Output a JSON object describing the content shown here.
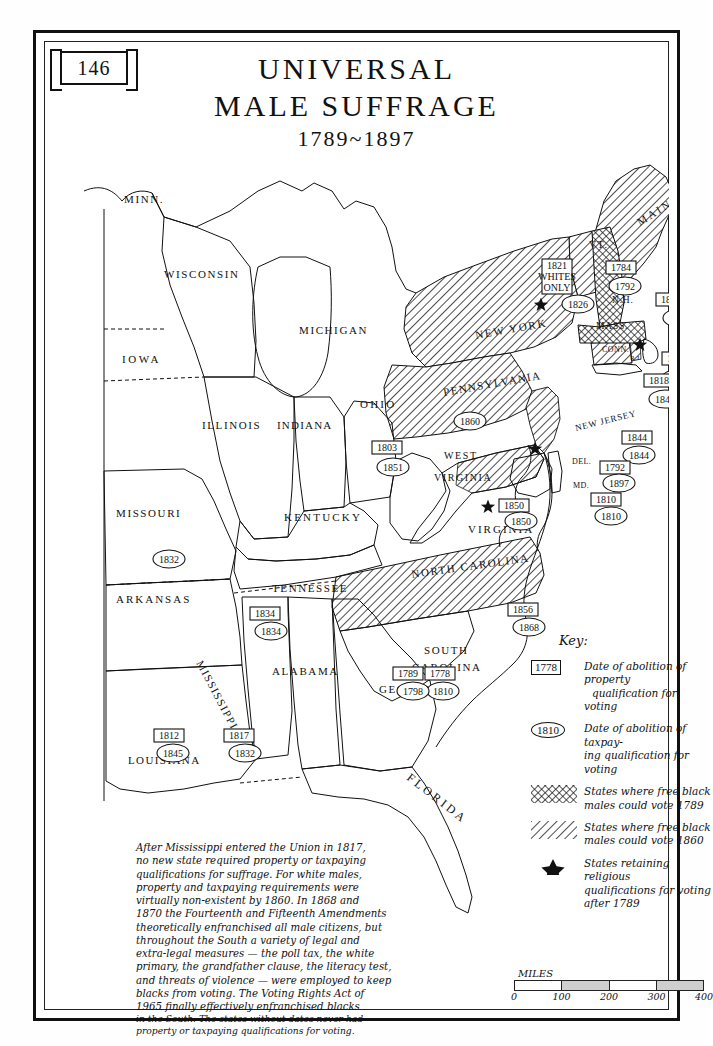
{
  "page": {
    "number": "146"
  },
  "title": {
    "line1": "UNIVERSAL",
    "line2": "MALE SUFFRAGE",
    "years": "1789~1897"
  },
  "key": {
    "heading": "Key:",
    "items": [
      {
        "symbol": "rect",
        "sample": "1778",
        "line1": "Date of abolition of property",
        "line2": "qualification  for voting"
      },
      {
        "symbol": "oval",
        "sample": "1810",
        "line1": "Date of abolition of taxpay-",
        "line2": "ing qualification for voting"
      },
      {
        "symbol": "hatch-1789",
        "sample": "",
        "line1": "States where free black",
        "line2": "males could vote 1789"
      },
      {
        "symbol": "hatch-1860",
        "sample": "",
        "line1": "States where free black",
        "line2": "males could vote 1860"
      },
      {
        "symbol": "star",
        "sample": "",
        "line1": "States retaining religious",
        "line2": "qualifications for voting",
        "line3": "after 1789"
      }
    ]
  },
  "note": {
    "lines": [
      "After Mississippi entered the Union in 1817,",
      "no new state required property or taxpaying",
      "qualifications for suffrage. For white males,",
      "property and taxpaying requirements were",
      "virtually non-existent by 1860. In 1868 and",
      "1870 the Fourteenth and Fifteenth Amendments",
      "theoretically enfranchised all male citizens, but",
      "throughout the South a variety of legal and",
      "extra-legal measures — the poll tax, the white",
      "primary, the grandfather clause, the literacy test,",
      "and threats of violence — were employed to keep",
      "blacks from voting. The Voting Rights Act of",
      "1965 finally effectively enfranchised blacks",
      "in the South. The states without dates never had",
      "property or taxpaying qualifications for voting."
    ]
  },
  "scale": {
    "label": "MILES",
    "ticks": [
      "0",
      "100",
      "200",
      "300",
      "400"
    ]
  },
  "states": [
    {
      "name": "MINN.",
      "x": 80,
      "y": 162,
      "size": 11,
      "spacing": 1.6
    },
    {
      "name": "WISCONSIN",
      "x": 120,
      "y": 237,
      "size": 11,
      "spacing": 1.6
    },
    {
      "name": "MICHIGAN",
      "x": 255,
      "y": 293,
      "size": 11,
      "spacing": 1.6
    },
    {
      "name": "IOWA",
      "x": 78,
      "y": 322,
      "size": 11,
      "spacing": 2.6
    },
    {
      "name": "ILLINOIS",
      "x": 158,
      "y": 388,
      "size": 11,
      "spacing": 1.6
    },
    {
      "name": "INDIANA",
      "x": 233,
      "y": 388,
      "size": 11,
      "spacing": 1.2
    },
    {
      "name": "OHIO",
      "x": 316,
      "y": 367,
      "size": 11,
      "spacing": 2.2
    },
    {
      "name": "MISSOURI",
      "x": 72,
      "y": 476,
      "size": 11,
      "spacing": 1.6
    },
    {
      "name": "KENTUCKY",
      "x": 240,
      "y": 480,
      "size": 11,
      "spacing": 2.2
    },
    {
      "name": "WEST",
      "x": 400,
      "y": 418,
      "size": 10,
      "spacing": 1.6
    },
    {
      "name": "VIRGINIA",
      "x": 390,
      "y": 440,
      "size": 10,
      "spacing": 1.6
    },
    {
      "name": "VIRGINIA",
      "x": 424,
      "y": 492,
      "size": 11,
      "spacing": 2.0
    },
    {
      "name": "ARKANSAS",
      "x": 72,
      "y": 562,
      "size": 11,
      "spacing": 2.0
    },
    {
      "name": "TENNESSEE",
      "x": 228,
      "y": 551,
      "size": 11,
      "spacing": 1.6
    },
    {
      "name": "MISSISSIPPI",
      "x": 152,
      "y": 622,
      "size": 11,
      "spacing": 1.4,
      "rotate": 62
    },
    {
      "name": "ALABAMA",
      "x": 228,
      "y": 634,
      "size": 11,
      "spacing": 1.6
    },
    {
      "name": "LOUISIANA",
      "x": 84,
      "y": 723,
      "size": 11,
      "spacing": 1.4
    },
    {
      "name": "GEORGIA",
      "x": 335,
      "y": 652,
      "size": 11,
      "spacing": 1.6
    },
    {
      "name": "FLORIDA",
      "x": 362,
      "y": 738,
      "size": 12,
      "spacing": 3.0,
      "rotate": 38
    },
    {
      "name": "SOUTH",
      "x": 380,
      "y": 613,
      "size": 11,
      "spacing": 1.6
    },
    {
      "name": "CAROLINA",
      "x": 368,
      "y": 630,
      "size": 11,
      "spacing": 1.6
    },
    {
      "name": "NORTH CAROLINA",
      "x": 368,
      "y": 537,
      "size": 11,
      "spacing": 1.6,
      "rotate": -8
    },
    {
      "name": "PENNSYLVANIA",
      "x": 400,
      "y": 355,
      "size": 11,
      "spacing": 1.4,
      "rotate": -10
    },
    {
      "name": "NEW YORK",
      "x": 432,
      "y": 298,
      "size": 11,
      "spacing": 1.8,
      "rotate": -10
    },
    {
      "name": "MAINE",
      "x": 596,
      "y": 185,
      "size": 11,
      "spacing": 2.4,
      "rotate": -32
    },
    {
      "name": "VT.",
      "x": 545,
      "y": 207,
      "size": 10,
      "spacing": 1.4
    },
    {
      "name": "N.H.",
      "x": 568,
      "y": 262,
      "size": 9.5,
      "spacing": 0.8
    },
    {
      "name": "MASS.",
      "x": 552,
      "y": 288,
      "size": 9.5,
      "spacing": 0.8
    },
    {
      "name": "CONN.",
      "x": 558,
      "y": 311,
      "size": 8,
      "spacing": 0.5
    },
    {
      "name": "R.I.",
      "x": 586,
      "y": 319,
      "size": 7,
      "spacing": 0.3
    },
    {
      "name": "NEW JERSEY",
      "x": 532,
      "y": 390,
      "size": 9,
      "spacing": 0.8,
      "rotate": -14
    },
    {
      "name": "DEL.",
      "x": 528,
      "y": 423,
      "size": 8,
      "spacing": 0.4
    },
    {
      "name": "MD.",
      "x": 529,
      "y": 447,
      "size": 8,
      "spacing": 0.4
    }
  ],
  "date_labels": [
    {
      "state": "new-york",
      "rect": "1821",
      "rect_extra": [
        "WHITES",
        "ONLY"
      ],
      "oval": "1826",
      "rx": 498,
      "ry": 218,
      "ox": 519,
      "oy": 256
    },
    {
      "state": "new-hampshire",
      "rect": "1784",
      "oval": "1792",
      "rx": 562,
      "ry": 220,
      "ox": 566,
      "oy": 238
    },
    {
      "state": "massachusetts",
      "rect": "1821",
      "oval": "1863",
      "rx": 612,
      "ry": 252,
      "ox": 620,
      "oy": 270
    },
    {
      "state": "rhode-island",
      "rect": "1842",
      "oval": "1860",
      "rx": 618,
      "ry": 311,
      "ox": 618,
      "oy": 331
    },
    {
      "state": "connecticut",
      "rect": "1818",
      "oval": "1845",
      "rx": 600,
      "ry": 333,
      "ox": 606,
      "oy": 351
    },
    {
      "state": "pennsylvania",
      "rect": "",
      "oval": "1860",
      "ox": 411,
      "oy": 373
    },
    {
      "state": "new-jersey",
      "rect": "1844",
      "oval": "1844",
      "rx": 578,
      "ry": 390,
      "ox": 580,
      "oy": 407
    },
    {
      "state": "delaware",
      "rect": "1792",
      "oval": "1897",
      "rx": 556,
      "ry": 420,
      "ox": 560,
      "oy": 435
    },
    {
      "state": "maryland",
      "rect": "1810",
      "oval": "1810",
      "rx": 547,
      "ry": 452,
      "ox": 552,
      "oy": 468
    },
    {
      "state": "ohio",
      "rect": "1803",
      "oval": "1851",
      "rx": 328,
      "ry": 400,
      "ox": 334,
      "oy": 419
    },
    {
      "state": "virginia",
      "rect": "1850",
      "oval": "1850",
      "rx": 455,
      "ry": 458,
      "ox": 462,
      "oy": 473
    },
    {
      "state": "missouri",
      "rect": "",
      "oval": "1832",
      "ox": 110,
      "oy": 511
    },
    {
      "state": "tennessee",
      "rect": "1834",
      "oval": "1834",
      "rx": 206,
      "ry": 566,
      "ox": 212,
      "oy": 583
    },
    {
      "state": "north-carolina",
      "rect": "1856",
      "oval": "1868",
      "rx": 464,
      "ry": 562,
      "ox": 470,
      "oy": 579
    },
    {
      "state": "south-carolina",
      "rect": "1778",
      "oval": "1810",
      "rx": 381,
      "ry": 626,
      "ox": 384,
      "oy": 643
    },
    {
      "state": "georgia",
      "rect": "1789",
      "oval": "1798",
      "rx": 349,
      "ry": 626,
      "ox": 354,
      "oy": 643
    },
    {
      "state": "louisiana",
      "rect": "1812",
      "oval": "1845",
      "rx": 110,
      "ry": 688,
      "ox": 114,
      "oy": 705
    },
    {
      "state": "mississippi",
      "rect": "1817",
      "oval": "1832",
      "rx": 180,
      "ry": 688,
      "ox": 186,
      "oy": 705
    }
  ],
  "religious_stars": [
    {
      "state": "new-york",
      "x": 497,
      "y": 264
    },
    {
      "state": "massachusetts",
      "x": 596,
      "y": 304
    },
    {
      "state": "new-jersey",
      "x": 491,
      "y": 408
    },
    {
      "state": "virginia",
      "x": 444,
      "y": 466
    }
  ],
  "colors": {
    "ink": "#111111",
    "line": "#222222",
    "paper": "#ffffff",
    "scale_fill": "#cfcfcf"
  }
}
